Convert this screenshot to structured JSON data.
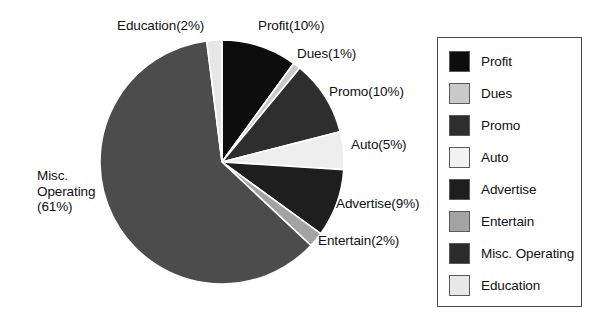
{
  "chart_data": {
    "type": "pie",
    "title": "",
    "xlabel": "",
    "ylabel": "",
    "legend_position": "right",
    "grid": false,
    "start_angle_deg": -90,
    "direction": "clockwise",
    "center": {
      "x": 222,
      "y": 162
    },
    "radius": 122,
    "categories": [
      "Profit",
      "Dues",
      "Promo",
      "Auto",
      "Advertise",
      "Entertain",
      "Misc. Operating",
      "Education"
    ],
    "values": [
      10,
      1,
      10,
      5,
      9,
      2,
      61,
      2
    ],
    "unit": "%",
    "colors": [
      "#0d0d0d",
      "#c9c9c9",
      "#2e2e2e",
      "#eeeeee",
      "#1e1e1e",
      "#a3a3a3",
      "#4c4c4c",
      "#e6e6e6"
    ],
    "slices": [
      {
        "name": "Profit",
        "value": 10,
        "label": "Profit(10%)",
        "color": "#0d0d0d"
      },
      {
        "name": "Dues",
        "value": 1,
        "label": "Dues(1%)",
        "color": "#c9c9c9"
      },
      {
        "name": "Promo",
        "value": 10,
        "label": "Promo(10%)",
        "color": "#2e2e2e"
      },
      {
        "name": "Auto",
        "value": 5,
        "label": "Auto(5%)",
        "color": "#eeeeee"
      },
      {
        "name": "Advertise",
        "value": 9,
        "label": "Advertise(9%)",
        "color": "#1e1e1e"
      },
      {
        "name": "Entertain",
        "value": 2,
        "label": "Entertain(2%)",
        "color": "#a3a3a3"
      },
      {
        "name": "Misc. Operating",
        "value": 61,
        "label": "Misc. Operating (61%)",
        "color": "#4c4c4c"
      },
      {
        "name": "Education",
        "value": 2,
        "label": "Education(2%)",
        "color": "#e6e6e6"
      }
    ]
  },
  "pie_labels": {
    "education": "Education(2%)",
    "profit": "Profit(10%)",
    "dues": "Dues(1%)",
    "promo": "Promo(10%)",
    "auto": "Auto(5%)",
    "advertise": "Advertise(9%)",
    "entertain": "Entertain(2%)",
    "misc_operating_line1": "Misc.",
    "misc_operating_line2": "Operating",
    "misc_operating_line3": "(61%)"
  },
  "legend": {
    "items": [
      {
        "label": "Profit",
        "color": "#0d0d0d"
      },
      {
        "label": "Dues",
        "color": "#c9c9c9"
      },
      {
        "label": "Promo",
        "color": "#2e2e2e"
      },
      {
        "label": "Auto",
        "color": "#f2f2f2"
      },
      {
        "label": "Advertise",
        "color": "#1e1e1e"
      },
      {
        "label": "Entertain",
        "color": "#a3a3a3"
      },
      {
        "label": "Misc. Operating",
        "color": "#2b2b2b"
      },
      {
        "label": "Education",
        "color": "#e8e8e8"
      }
    ]
  }
}
